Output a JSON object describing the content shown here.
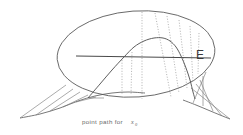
{
  "figure": {
    "background_color": "#ffffff",
    "ink_color": "#555555",
    "dotted_color": "#9a9a9a",
    "fan_color": "#7d7d7d",
    "axis_color": "#4a4a4a",
    "labels": {
      "set_label": "E",
      "caption_text": "point path for",
      "caption_variable": "x",
      "caption_subscript": "0"
    }
  },
  "chart_data": {
    "type": "line",
    "xlabel": "",
    "ylabel": "",
    "grid": false,
    "legend": false,
    "xlim": [
      0,
      243
    ],
    "ylim": [
      0,
      135
    ],
    "ellipse": {
      "name": "E",
      "center_x": 136,
      "center_y": 54,
      "radius_x": 79,
      "radius_y": 43,
      "rotation_deg": -4
    },
    "axis_line": {
      "name": "horizontal-axis",
      "x1": 76,
      "y1": 56,
      "x2": 211,
      "y2": 58
    },
    "point_path": {
      "name": "point-path-curve",
      "points": [
        [
          88,
          98
        ],
        [
          100,
          84
        ],
        [
          112,
          70
        ],
        [
          124,
          57
        ],
        [
          134,
          47
        ],
        [
          144,
          41
        ],
        [
          154,
          38
        ],
        [
          163,
          38
        ],
        [
          170,
          41
        ],
        [
          176,
          47
        ],
        [
          181,
          56
        ],
        [
          186,
          68
        ],
        [
          190,
          80
        ],
        [
          193,
          92
        ],
        [
          195,
          99
        ]
      ]
    },
    "projection_dotted_lines": [
      {
        "name": "dotted-1",
        "x1": 142,
        "y1": 12,
        "x2": 142,
        "y2": 99
      },
      {
        "name": "dotted-2",
        "x1": 155,
        "y1": 13,
        "x2": 171,
        "y2": 97
      },
      {
        "name": "dotted-3",
        "x1": 167,
        "y1": 16,
        "x2": 179,
        "y2": 93
      },
      {
        "name": "dotted-4",
        "x1": 179,
        "y1": 20,
        "x2": 187,
        "y2": 88
      },
      {
        "name": "dotted-5",
        "x1": 190,
        "y1": 26,
        "x2": 193,
        "y2": 82
      },
      {
        "name": "dotted-6",
        "x1": 199,
        "y1": 33,
        "x2": 198,
        "y2": 74
      },
      {
        "name": "dotted-7",
        "x1": 122,
        "y1": 60,
        "x2": 122,
        "y2": 94
      },
      {
        "name": "dotted-8",
        "x1": 132,
        "y1": 52,
        "x2": 131,
        "y2": 95
      }
    ],
    "fan_left": {
      "name": "fan-left-projection",
      "apex_curve": [
        [
          20,
          118
        ],
        [
          40,
          114
        ],
        [
          60,
          108
        ],
        [
          78,
          101
        ],
        [
          95,
          96
        ],
        [
          112,
          93
        ],
        [
          128,
          92
        ],
        [
          145,
          93
        ]
      ],
      "rays": [
        {
          "x1": 66,
          "y1": 85,
          "x2": 20,
          "y2": 118
        },
        {
          "x1": 73,
          "y1": 89,
          "x2": 36,
          "y2": 115
        },
        {
          "x1": 80,
          "y1": 92,
          "x2": 50,
          "y2": 111
        },
        {
          "x1": 88,
          "y1": 95,
          "x2": 63,
          "y2": 107
        },
        {
          "x1": 96,
          "y1": 97,
          "x2": 76,
          "y2": 102
        },
        {
          "x1": 104,
          "y1": 98,
          "x2": 89,
          "y2": 98
        }
      ]
    },
    "fan_right": {
      "name": "fan-right-projection",
      "apex_curve": [
        [
          183,
          100
        ],
        [
          196,
          105
        ],
        [
          208,
          110
        ],
        [
          220,
          115
        ],
        [
          230,
          119
        ]
      ],
      "rays": [
        {
          "x1": 191,
          "y1": 88,
          "x2": 230,
          "y2": 119
        },
        {
          "x1": 196,
          "y1": 84,
          "x2": 222,
          "y2": 116
        },
        {
          "x1": 200,
          "y1": 80,
          "x2": 213,
          "y2": 111
        },
        {
          "x1": 203,
          "y1": 76,
          "x2": 203,
          "y2": 106
        },
        {
          "x1": 206,
          "y1": 72,
          "x2": 193,
          "y2": 103
        }
      ]
    }
  }
}
